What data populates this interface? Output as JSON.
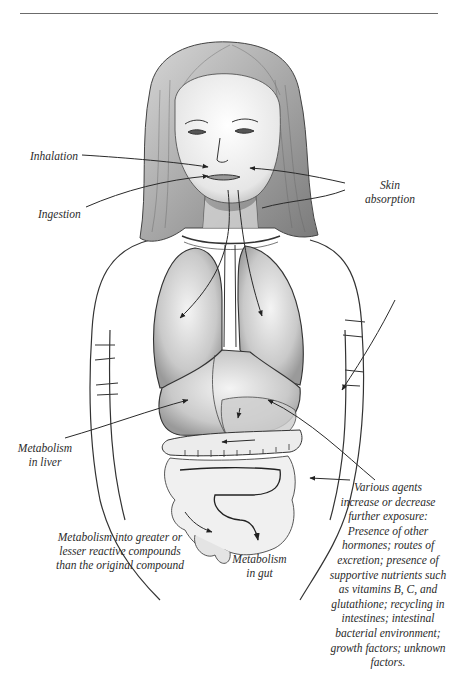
{
  "figure": {
    "colors": {
      "line": "#2a2a2a",
      "shade": "#9a9a9a",
      "background": "#ffffff",
      "rule": "#6b6b6b"
    }
  },
  "labels": {
    "inhalation": "Inhalation",
    "ingestion": "Ingestion",
    "skin_absorption": [
      "Skin",
      "absorption"
    ],
    "metabolism_liver": [
      "Metabolism",
      "in liver"
    ],
    "metabolism_reactive": [
      "Metabolism into greater or",
      "lesser reactive compounds",
      "than the original compound"
    ],
    "metabolism_gut": [
      "Metabolism",
      "in gut"
    ],
    "various_agents": [
      "Various agents",
      "increase or decrease",
      "further exposure:",
      "Presence of other",
      "hormones; routes of",
      "excretion; presence of",
      "supportive nutrients such",
      "as vitamins B, C, and",
      "glutathione; recycling in",
      "intestines; intestinal",
      "bacterial environment;",
      "growth factors; unknown",
      "factors."
    ]
  }
}
